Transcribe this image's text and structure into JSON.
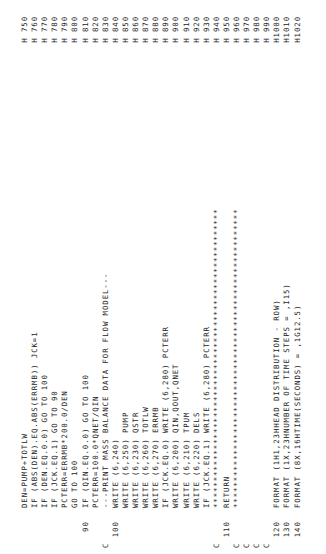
{
  "listing": {
    "lines": [
      {
        "label": "",
        "code": "DEN=PUMP+TOTLW",
        "seq": "H 750"
      },
      {
        "label": "",
        "code": "IF (ABS(DEN).EQ.ABS(ERRMB)) JCK=1",
        "seq": "H 760"
      },
      {
        "label": "",
        "code": "IF (DEN.EQ.0.0) GO TO 100",
        "seq": "H 770"
      },
      {
        "label": "",
        "code": "IF (JCK.EQ.1) GO TO 90",
        "seq": "H 780"
      },
      {
        "label": "",
        "code": "PCTERR=ERRMB*200.0/DEN",
        "seq": "H 790"
      },
      {
        "label": "",
        "code": "GO TO 100",
        "seq": "H 800"
      },
      {
        "label": "   90",
        "code": "IF (QIN.EQ.0.0) GO TO 100",
        "seq": "H 810"
      },
      {
        "label": "",
        "code": "PCTERR=100.0*QNET/QIN",
        "seq": "H 820"
      },
      {
        "label": "C",
        "code": "---PRINT MASS BALANCE DATA FOR FLOW MODEL---",
        "seq": "H 830"
      },
      {
        "label": "  100",
        "code": "WRITE (6,240)",
        "seq": "H 840"
      },
      {
        "label": "",
        "code": "WRITE (6,250) PUMP",
        "seq": "H 850"
      },
      {
        "label": "",
        "code": "WRITE (6,230) QSTR",
        "seq": "H 860"
      },
      {
        "label": "",
        "code": "WRITE (6,260) TOTLW",
        "seq": "H 870"
      },
      {
        "label": "",
        "code": "WRITE (6,270) ERRMB",
        "seq": "H 880"
      },
      {
        "label": "",
        "code": "IF (JCK.EQ.0) WRITE (6,280) PCTERR",
        "seq": "H 890"
      },
      {
        "label": "",
        "code": "WRITE (6,200) QIN,QOUT,QNET",
        "seq": "H 900"
      },
      {
        "label": "",
        "code": "WRITE (6,210) TPUM",
        "seq": "H 910"
      },
      {
        "label": "",
        "code": "WRITE (6,220) DELS",
        "seq": "H 920"
      },
      {
        "label": "",
        "code": "IF (JCK.EQ.1) WRITE (6,280) PCTERR",
        "seq": "H 930"
      },
      {
        "label": "C",
        "code": "********************************************************",
        "seq": "H 940"
      },
      {
        "label": "  110",
        "code": "RETURN",
        "seq": "H 950"
      },
      {
        "label": "C",
        "code": "********************************************************",
        "seq": "H 960"
      },
      {
        "label": "C",
        "code": "",
        "seq": "H 970"
      },
      {
        "label": "C",
        "code": "",
        "seq": "H 980"
      },
      {
        "label": "C",
        "code": "",
        "seq": "H 990"
      },
      {
        "label": "  120",
        "code": "FORMAT (1H1,23HHEAD DISTRIBUTION - ROW)",
        "seq": "H1000"
      },
      {
        "label": "  130",
        "code": "FORMAT (1X,23HNUMBER OF TIME STEPS = ,I15)",
        "seq": "H1010"
      },
      {
        "label": "  140",
        "code": "FORMAT (8X,16HTIME(SECONDS) = ,1G12.5)",
        "seq": "H1020"
      }
    ]
  }
}
